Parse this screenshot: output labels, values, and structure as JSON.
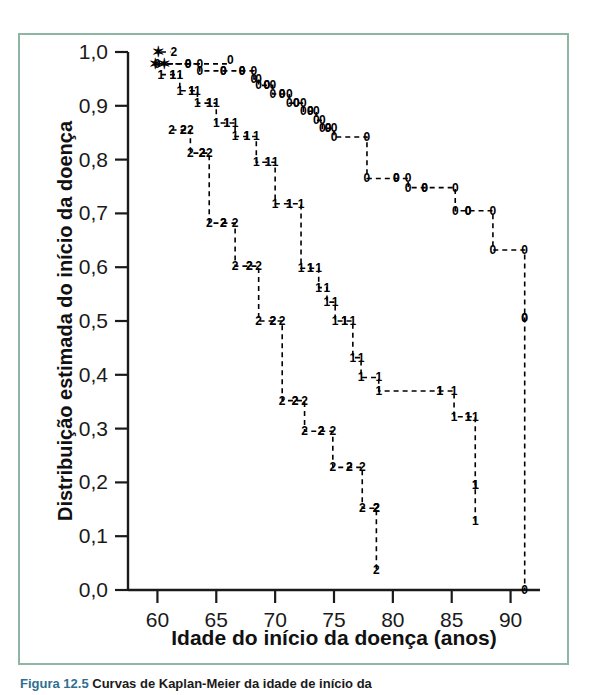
{
  "figure": {
    "caption_label": "Figura 12.5",
    "caption_text": "Curvas de Kaplan-Meier da idade de início da",
    "border_color": "#8fb5a4",
    "background_color": "#ffffff",
    "line_color": "#000000"
  },
  "chart_data": {
    "type": "line",
    "title": "",
    "subtitle": "",
    "xlabel": "Idade do início da doença (anos)",
    "ylabel": "Distribuição estimada do início da doença",
    "xlim": [
      57.5,
      92.5
    ],
    "ylim": [
      0.0,
      1.0
    ],
    "xticks": [
      60,
      65,
      70,
      75,
      80,
      85,
      90
    ],
    "xtick_labels": [
      "60",
      "65",
      "70",
      "75",
      "80",
      "85",
      "90"
    ],
    "yticks": [
      0.0,
      0.1,
      0.2,
      0.3,
      0.4,
      0.5,
      0.6,
      0.7,
      0.8,
      0.9,
      1.0
    ],
    "ytick_labels": [
      "0,0",
      "0,1",
      "0,2",
      "0,3",
      "0,4",
      "0,5",
      "0,6",
      "0,7",
      "0,8",
      "0,9",
      "1,0"
    ],
    "grid": false,
    "legend_position": "none",
    "decimal_separator": ",",
    "series": [
      {
        "name": "0",
        "marker_label": "0",
        "point_labels": [
          "0",
          "0",
          "0",
          "0",
          "0",
          "0",
          "0",
          "0",
          "0",
          "0",
          "0",
          "0",
          "0",
          "0",
          "0",
          "0",
          "0",
          "0",
          "0",
          "0",
          "0",
          "0",
          "0",
          "0",
          "0"
        ],
        "x": [
          60.0,
          62.6,
          63.6,
          65.6,
          67.2,
          68.2,
          68.6,
          69.3,
          69.8,
          70.6,
          71.2,
          71.8,
          72.4,
          73.0,
          73.5,
          74.0,
          74.5,
          75.0,
          77.8,
          80.3,
          81.3,
          82.7,
          85.3,
          86.4,
          88.5,
          91.2,
          91.2
        ],
        "y": [
          0.978,
          0.978,
          0.965,
          0.965,
          0.965,
          0.95,
          0.938,
          0.938,
          0.922,
          0.922,
          0.905,
          0.905,
          0.89,
          0.89,
          0.873,
          0.858,
          0.858,
          0.842,
          0.765,
          0.765,
          0.748,
          0.748,
          0.705,
          0.705,
          0.632,
          0.505,
          0.0
        ]
      },
      {
        "name": "1",
        "marker_label": "1",
        "point_labels": [
          "1",
          "1",
          "1",
          "1",
          "1",
          "1",
          "1",
          "1",
          "1",
          "1",
          "1",
          "1",
          "1",
          "1",
          "1",
          "1",
          "1",
          "1",
          "1",
          "1",
          "1",
          "1",
          "1",
          "1",
          "1"
        ],
        "x": [
          60.3,
          61.3,
          61.9,
          62.9,
          63.4,
          64.4,
          65.0,
          65.9,
          66.6,
          67.6,
          68.4,
          69.4,
          70.0,
          71.2,
          72.2,
          73.0,
          73.7,
          74.4,
          75.1,
          75.9,
          76.6,
          77.3,
          78.8,
          84.0,
          85.2,
          86.4,
          87.0,
          87.0
        ],
        "y": [
          0.958,
          0.958,
          0.928,
          0.928,
          0.905,
          0.905,
          0.868,
          0.868,
          0.843,
          0.843,
          0.795,
          0.795,
          0.718,
          0.718,
          0.598,
          0.598,
          0.562,
          0.535,
          0.5,
          0.5,
          0.432,
          0.395,
          0.37,
          0.37,
          0.322,
          0.322,
          0.195,
          0.128
        ]
      },
      {
        "name": "2",
        "marker_label": "2",
        "point_labels": [
          "2",
          "2",
          "2",
          "2",
          "2",
          "2",
          "2",
          "2",
          "2",
          "2",
          "2",
          "2",
          "2",
          "2",
          "2",
          "2",
          "2"
        ],
        "x": [
          61.2,
          62.2,
          62.8,
          63.8,
          64.4,
          65.6,
          66.6,
          67.8,
          68.6,
          69.8,
          70.6,
          71.7,
          72.5,
          73.9,
          74.9,
          76.3,
          77.4,
          78.6,
          78.6
        ],
        "y": [
          0.855,
          0.855,
          0.812,
          0.812,
          0.682,
          0.682,
          0.602,
          0.602,
          0.5,
          0.5,
          0.352,
          0.352,
          0.295,
          0.295,
          0.228,
          0.228,
          0.152,
          0.152,
          0.038
        ]
      }
    ],
    "censored_marks": [
      {
        "label": "star",
        "x": 60.1,
        "y": 1.0
      },
      {
        "label": "star",
        "x": 59.8,
        "y": 0.978
      },
      {
        "label": "star",
        "x": 60.6,
        "y": 0.978
      }
    ],
    "censored_group_labels": [
      {
        "label": "2",
        "x": 61.4,
        "y": 1.0
      },
      {
        "label": "0",
        "x": 66.2,
        "y": 0.985
      }
    ]
  }
}
